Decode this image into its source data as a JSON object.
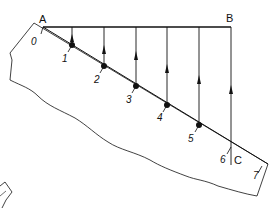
{
  "diagram": {
    "title": "",
    "points": {
      "A": "A",
      "B": "B",
      "C": "C"
    },
    "divisions": [
      "0",
      "1",
      "2",
      "3",
      "4",
      "5",
      "6",
      "7"
    ],
    "colors": {
      "line": "#111111",
      "background": "#ffffff"
    }
  }
}
